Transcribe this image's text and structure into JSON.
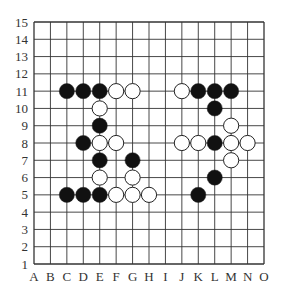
{
  "board": {
    "size": 15,
    "columns": [
      "A",
      "B",
      "C",
      "D",
      "E",
      "F",
      "G",
      "H",
      "I",
      "J",
      "K",
      "L",
      "M",
      "N",
      "O"
    ],
    "rows": [
      "1",
      "2",
      "3",
      "4",
      "5",
      "6",
      "7",
      "8",
      "9",
      "10",
      "11",
      "12",
      "13",
      "14",
      "15"
    ],
    "colors": {
      "line": "#333333",
      "black_stone": "#111111",
      "white_stone": "#ffffff",
      "label": "#333333"
    },
    "stones": [
      {
        "col": "C",
        "row": 11,
        "color": "black"
      },
      {
        "col": "D",
        "row": 11,
        "color": "black"
      },
      {
        "col": "E",
        "row": 11,
        "color": "black"
      },
      {
        "col": "F",
        "row": 11,
        "color": "white"
      },
      {
        "col": "G",
        "row": 11,
        "color": "white"
      },
      {
        "col": "J",
        "row": 11,
        "color": "white"
      },
      {
        "col": "K",
        "row": 11,
        "color": "black"
      },
      {
        "col": "L",
        "row": 11,
        "color": "black"
      },
      {
        "col": "M",
        "row": 11,
        "color": "black"
      },
      {
        "col": "E",
        "row": 10,
        "color": "white"
      },
      {
        "col": "L",
        "row": 10,
        "color": "black"
      },
      {
        "col": "E",
        "row": 9,
        "color": "black"
      },
      {
        "col": "M",
        "row": 9,
        "color": "white"
      },
      {
        "col": "D",
        "row": 8,
        "color": "black"
      },
      {
        "col": "E",
        "row": 8,
        "color": "white"
      },
      {
        "col": "F",
        "row": 8,
        "color": "white"
      },
      {
        "col": "J",
        "row": 8,
        "color": "white"
      },
      {
        "col": "K",
        "row": 8,
        "color": "white"
      },
      {
        "col": "L",
        "row": 8,
        "color": "black"
      },
      {
        "col": "M",
        "row": 8,
        "color": "white"
      },
      {
        "col": "N",
        "row": 8,
        "color": "white"
      },
      {
        "col": "E",
        "row": 7,
        "color": "black"
      },
      {
        "col": "G",
        "row": 7,
        "color": "black"
      },
      {
        "col": "M",
        "row": 7,
        "color": "white"
      },
      {
        "col": "E",
        "row": 6,
        "color": "white"
      },
      {
        "col": "G",
        "row": 6,
        "color": "white"
      },
      {
        "col": "L",
        "row": 6,
        "color": "black"
      },
      {
        "col": "C",
        "row": 5,
        "color": "black"
      },
      {
        "col": "D",
        "row": 5,
        "color": "black"
      },
      {
        "col": "E",
        "row": 5,
        "color": "black"
      },
      {
        "col": "F",
        "row": 5,
        "color": "white"
      },
      {
        "col": "G",
        "row": 5,
        "color": "white"
      },
      {
        "col": "H",
        "row": 5,
        "color": "white"
      },
      {
        "col": "K",
        "row": 5,
        "color": "black"
      }
    ]
  }
}
